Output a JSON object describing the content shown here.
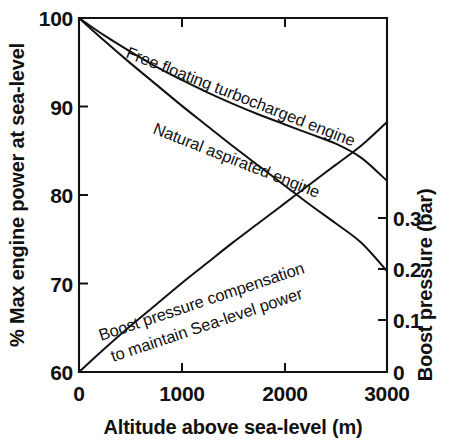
{
  "chart_data": {
    "type": "line",
    "title": "",
    "xlabel": "Altitude above sea-level (m)",
    "ylabel": "% Max engine power at sea-level",
    "y2label": "Boost pressure (bar)",
    "xlim": [
      0,
      3000
    ],
    "ylim": [
      60,
      100
    ],
    "y2lim": [
      0,
      0.3469
    ],
    "grid": false,
    "legend": "inline-curve-labels",
    "xticks": [
      0,
      1000,
      2000,
      3000
    ],
    "xticklabels": [
      "0",
      "1000",
      "2000",
      "3000"
    ],
    "yticks": [
      60,
      70,
      80,
      90,
      100
    ],
    "yticklabels": [
      "60",
      "70",
      "80",
      "90",
      "100"
    ],
    "y2ticks": [
      0,
      0.1,
      0.2,
      0.3
    ],
    "y2ticklabels": [
      "0",
      "0.1",
      "0.2",
      "0.3"
    ],
    "series": [
      {
        "name": "Free floating turbocharged engine",
        "axis": "left",
        "label_line1": "Free floating turbocharged engine",
        "x": [
          0,
          250,
          500,
          750,
          1000,
          1250,
          1500,
          1750,
          2000,
          2250,
          2500,
          2750,
          3000
        ],
        "values": [
          100.0,
          98.0,
          96.2,
          94.5,
          93.0,
          91.6,
          90.3,
          89.1,
          88.0,
          86.9,
          85.8,
          84.2,
          81.6
        ]
      },
      {
        "name": "Natural aspirated engine",
        "axis": "left",
        "label_line1": "Natural aspirated engine",
        "x": [
          0,
          250,
          500,
          750,
          1000,
          1250,
          1500,
          1750,
          2000,
          2250,
          2500,
          2750,
          3000
        ],
        "values": [
          100.0,
          97.4,
          94.9,
          92.5,
          90.1,
          87.8,
          85.5,
          83.3,
          81.1,
          78.9,
          76.8,
          74.6,
          71.4
        ]
      },
      {
        "name": "Boost pressure compensation to maintain Sea-level power",
        "axis": "right",
        "label_line1": "Boost pressure compensation",
        "label_line2": "to maintain Sea-level power",
        "x": [
          0,
          250,
          500,
          750,
          1000,
          1250,
          1500,
          1750,
          2000,
          2250,
          2500,
          2750,
          3000
        ],
        "values": [
          0.0,
          0.023,
          0.045,
          0.066,
          0.087,
          0.107,
          0.127,
          0.146,
          0.165,
          0.184,
          0.203,
          0.222,
          0.245
        ]
      }
    ]
  }
}
